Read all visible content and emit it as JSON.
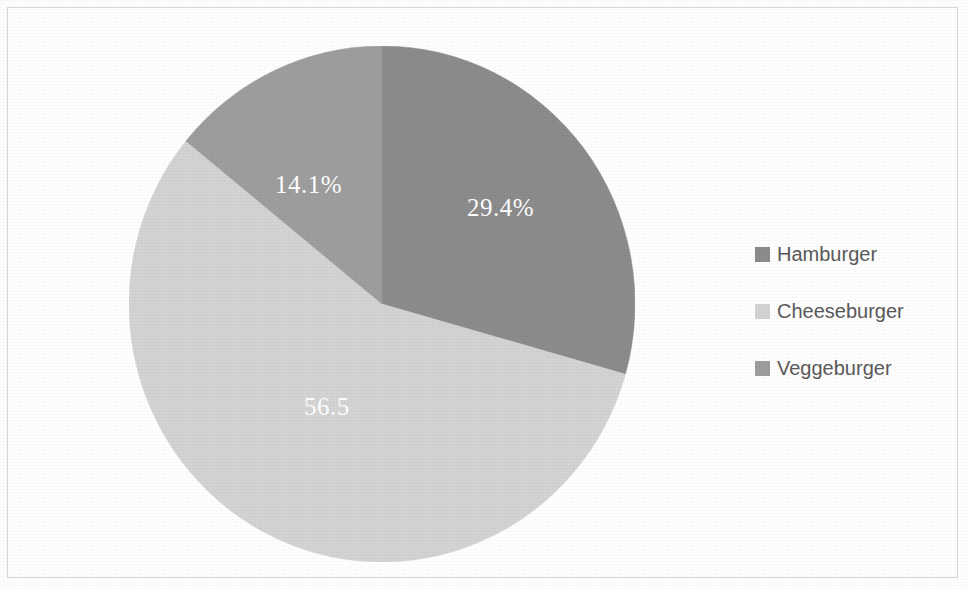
{
  "frame": {
    "border_color": "#d9d9d9",
    "background": "#ffffff"
  },
  "chart_data": {
    "type": "pie",
    "title": "",
    "subtitle": "",
    "xlabel": "",
    "ylabel": "",
    "grid": false,
    "legend_position": "right",
    "categories": [
      "Hamburger",
      "Cheeseburger",
      "Veggeburger"
    ],
    "values": [
      29.4,
      56.5,
      14.1
    ],
    "value_unit": "percent",
    "data_labels": [
      "29.4%",
      "56.5",
      "14.1%"
    ],
    "colors": [
      "#8c8c8c",
      "#d4d4d4",
      "#9e9e9e"
    ],
    "start_angle_deg": 0,
    "direction": "clockwise",
    "slices": [
      {
        "label": "Hamburger",
        "value": 29.4,
        "data_label": "29.4%",
        "color": "#8c8c8c",
        "start_angle_deg": 0,
        "end_angle_deg": 105.8
      },
      {
        "label": "Cheeseburger",
        "value": 56.5,
        "data_label": "56.5",
        "color": "#d4d4d4",
        "start_angle_deg": 105.8,
        "end_angle_deg": 309.2
      },
      {
        "label": "Veggeburger",
        "value": 14.1,
        "data_label": "14.1%",
        "color": "#9e9e9e",
        "start_angle_deg": 309.2,
        "end_angle_deg": 360
      }
    ]
  },
  "legend": {
    "items": [
      {
        "label": "Hamburger",
        "color": "#8c8c8c"
      },
      {
        "label": "Cheeseburger",
        "color": "#d4d4d4"
      },
      {
        "label": "Veggeburger",
        "color": "#9e9e9e"
      }
    ]
  }
}
